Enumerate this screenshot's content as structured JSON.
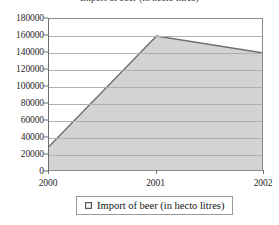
{
  "figure": {
    "cropped_title": "Import of beer (in hecto litres)"
  },
  "chart_data": {
    "type": "area",
    "title": "",
    "xlabel": "",
    "ylabel": "",
    "categories": [
      "2000",
      "2001",
      "2002"
    ],
    "values": [
      30000,
      160000,
      140000
    ],
    "series": [
      {
        "name": "Import of beer (in hecto litres)",
        "values": [
          30000,
          160000,
          140000
        ]
      }
    ],
    "ylim": [
      0,
      180000
    ],
    "ytick_step": 20000,
    "ytick_labels": [
      "180000",
      "160000",
      "140000",
      "120000",
      "100000",
      "80000",
      "60000",
      "40000",
      "20000",
      "0"
    ],
    "ytick_values": [
      180000,
      160000,
      140000,
      120000,
      100000,
      80000,
      60000,
      40000,
      20000,
      0
    ],
    "xtick_labels": [
      "2000",
      "2001",
      "2002"
    ],
    "grid": "horizontal",
    "legend_position": "bottom-center",
    "colors": {
      "area_fill": "#d3d3d3",
      "area_line": "#6e6e6e",
      "gridline": "#b0b0b0",
      "axis": "#6e6e6e",
      "frame": "#8c8c8c",
      "text": "#1f1f1f",
      "background": "#ffffff"
    }
  },
  "legend": {
    "entries": [
      {
        "label": "Import of beer (in hecto litres)",
        "swatch": "legend-swatch-gray"
      }
    ]
  }
}
